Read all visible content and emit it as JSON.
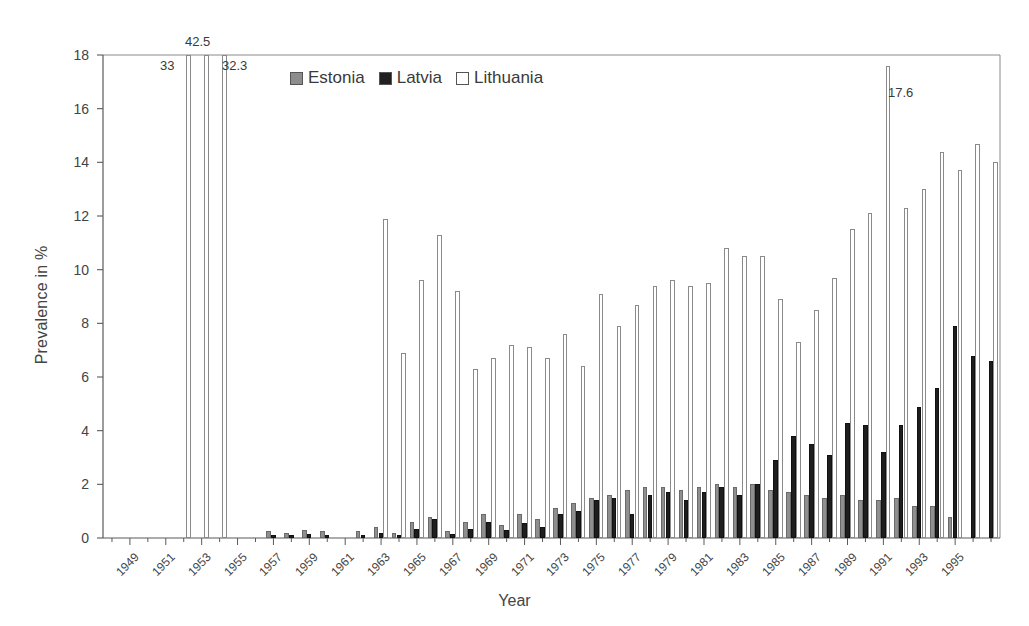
{
  "chart_data": {
    "type": "bar",
    "title": "",
    "xlabel": "Year",
    "ylabel": "Prevalence in %",
    "ylim": [
      0,
      18
    ],
    "ytick_step": 2,
    "yticks": [
      0,
      2,
      4,
      6,
      8,
      10,
      12,
      14,
      16,
      18
    ],
    "grid": false,
    "legend_position": "top-center",
    "xtick_step": 2,
    "xtick_labels": [
      "1949",
      "1951",
      "1953",
      "1955",
      "1957",
      "1959",
      "1961",
      "1963",
      "1965",
      "1967",
      "1969",
      "1971",
      "1973",
      "1975",
      "1977",
      "1979",
      "1981",
      "1983",
      "1985",
      "1987",
      "1989",
      "1991",
      "1993",
      "1995"
    ],
    "categories": [
      1948,
      1949,
      1950,
      1951,
      1952,
      1953,
      1954,
      1955,
      1956,
      1957,
      1958,
      1959,
      1960,
      1961,
      1962,
      1963,
      1964,
      1965,
      1966,
      1967,
      1968,
      1969,
      1970,
      1971,
      1972,
      1973,
      1974,
      1975,
      1976,
      1977,
      1978,
      1979,
      1980,
      1981,
      1982,
      1983,
      1984,
      1985,
      1986,
      1987,
      1988,
      1989,
      1990,
      1991,
      1992,
      1993,
      1994,
      1995,
      1996,
      1997
    ],
    "series": [
      {
        "name": "Estonia",
        "color": "#8f8f8f",
        "values": [
          0,
          0,
          0,
          0,
          0,
          0,
          0,
          0,
          0,
          0.25,
          0.2,
          0.3,
          0.25,
          0,
          0.25,
          0.4,
          0.2,
          0.6,
          0.8,
          0.25,
          0.6,
          0.9,
          0.5,
          0.9,
          0.7,
          1.1,
          1.3,
          1.5,
          1.6,
          1.8,
          1.9,
          1.9,
          1.8,
          1.9,
          2.0,
          1.9,
          2.0,
          1.8,
          1.7,
          1.6,
          1.5,
          1.6,
          1.4,
          1.4,
          1.5,
          1.2,
          1.2,
          0.8,
          0,
          0
        ]
      },
      {
        "name": "Latvia",
        "color": "#1e1e1e",
        "values": [
          0,
          0,
          0,
          0,
          0,
          0,
          0,
          0,
          0,
          0.1,
          0.1,
          0.15,
          0.1,
          0,
          0.1,
          0.2,
          0.1,
          0.35,
          0.7,
          0.15,
          0.35,
          0.6,
          0.3,
          0.55,
          0.4,
          0.9,
          1.0,
          1.4,
          1.5,
          0.9,
          1.6,
          1.7,
          1.4,
          1.7,
          1.9,
          1.6,
          2.0,
          2.9,
          3.8,
          3.5,
          3.1,
          4.3,
          4.2,
          3.2,
          4.2,
          4.9,
          5.6,
          7.9,
          6.8,
          6.6
        ]
      },
      {
        "name": "Lithuania",
        "color": "#ffffff",
        "values": [
          0,
          0,
          0,
          0,
          33,
          42.5,
          32.3,
          0,
          0,
          0,
          0,
          0,
          0,
          0,
          0,
          11.9,
          6.9,
          9.6,
          11.3,
          9.2,
          6.3,
          6.7,
          7.2,
          7.1,
          6.7,
          7.6,
          6.4,
          9.1,
          7.9,
          8.7,
          9.4,
          9.6,
          9.4,
          9.5,
          10.8,
          10.5,
          10.5,
          8.9,
          7.3,
          8.5,
          9.7,
          11.5,
          12.1,
          17.6,
          12.3,
          13.0,
          14.4,
          13.7,
          14.7,
          14.0
        ]
      }
    ],
    "annotations": [
      {
        "label": "33",
        "year": 1952,
        "x": 160,
        "y": 58
      },
      {
        "label": "42.5",
        "year": 1953,
        "x": 185,
        "y": 34
      },
      {
        "label": "32.3",
        "year": 1954,
        "x": 222,
        "y": 58
      },
      {
        "label": "17.6",
        "year": 1991,
        "x": 888,
        "y": 85
      }
    ]
  },
  "legend": {
    "items": [
      {
        "label": "Estonia",
        "swatch": "estonia"
      },
      {
        "label": "Latvia",
        "swatch": "latvia"
      },
      {
        "label": "Lithuania",
        "swatch": "lithuania"
      }
    ]
  }
}
